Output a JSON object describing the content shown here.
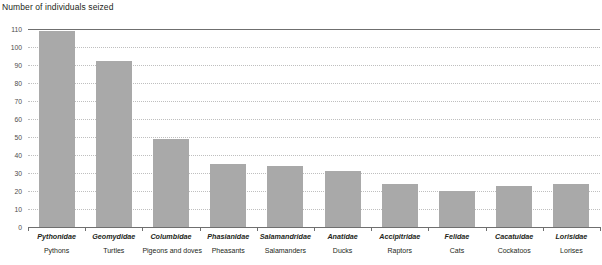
{
  "chart_data": {
    "type": "bar",
    "title": "Number of individuals seized",
    "xlabel": "",
    "ylabel": "",
    "ylim": [
      0,
      110
    ],
    "ytick_step": 10,
    "yticks": [
      "110",
      "100",
      "90",
      "80",
      "70",
      "60",
      "50",
      "40",
      "30",
      "20",
      "10",
      "0"
    ],
    "grid": "horizontal-dotted",
    "legend": "none",
    "bar_color": "#a9a9a9",
    "axis_color": "#6f6f6f",
    "grid_color": "#bfbfbf",
    "categories": [
      "Pythonidae",
      "Geomydidae",
      "Columbidae",
      "Phasianidae",
      "Salamandridae",
      "Anatidae",
      "Accipitridae",
      "Felidae",
      "Cacatuidae",
      "Lorisidae"
    ],
    "category_common_names": [
      "Pythons",
      "Turtles",
      "Pigeons and doves",
      "Pheasants",
      "Salamanders",
      "Ducks",
      "Raptors",
      "Cats",
      "Cockatoos",
      "Lorises"
    ],
    "values": [
      109,
      92,
      49,
      35,
      34,
      31,
      24,
      20,
      23,
      24
    ]
  }
}
